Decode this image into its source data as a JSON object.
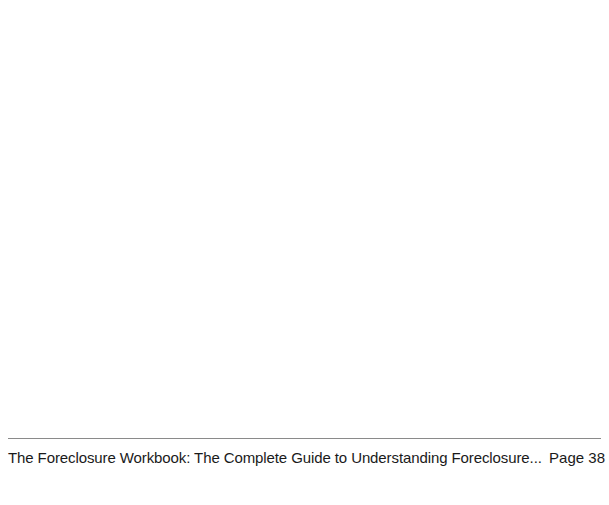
{
  "document": {
    "body_content": "",
    "footer": {
      "title": "The Foreclosure Workbook: The Complete Guide to Understanding Foreclosure...",
      "page_label": "Page 38"
    },
    "colors": {
      "background": "#ffffff",
      "rule": "#8a8a8a",
      "text": "#1a1a1a"
    }
  }
}
